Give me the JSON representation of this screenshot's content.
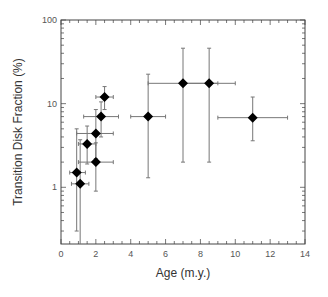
{
  "chart_data": {
    "type": "scatter",
    "title": "",
    "xlabel": "Age (m.y.)",
    "ylabel": "Transition Disk Fraction (%)",
    "xlim": [
      0,
      14
    ],
    "ylim": [
      0.21,
      100
    ],
    "yscale": "log",
    "grid": false,
    "legend": null,
    "x_ticks": [
      0,
      2,
      4,
      6,
      8,
      10,
      12,
      14
    ],
    "y_ticks": [
      1,
      10,
      100
    ],
    "x_tick_labels": [
      "0",
      "2",
      "4",
      "6",
      "8",
      "10",
      "12",
      "14"
    ],
    "y_tick_labels": [
      "1",
      "10",
      "100"
    ],
    "marker": "diamond",
    "marker_color": "#000000",
    "errorbar_color": "#777777",
    "points": [
      {
        "x": 0.9,
        "y": 1.5,
        "x_err": [
          0.5,
          1.4
        ],
        "y_err": [
          0.3,
          5.0
        ]
      },
      {
        "x": 1.1,
        "y": 1.1,
        "x_err": [
          0.6,
          1.6
        ],
        "y_err": [
          0.2,
          3.7
        ]
      },
      {
        "x": 1.5,
        "y": 3.3,
        "x_err": [
          1.0,
          2.0
        ],
        "y_err": [
          1.9,
          5.4
        ]
      },
      {
        "x": 2.0,
        "y": 2.0,
        "x_err": [
          1.0,
          3.0
        ],
        "y_err": [
          0.9,
          3.4
        ]
      },
      {
        "x": 2.0,
        "y": 4.4,
        "x_err": [
          0.9,
          3.0
        ],
        "y_err": [
          2.2,
          8.5
        ]
      },
      {
        "x": 2.3,
        "y": 7.0,
        "x_err": [
          1.3,
          3.3
        ],
        "y_err": [
          4.0,
          10.5
        ]
      },
      {
        "x": 2.5,
        "y": 12.0,
        "x_err": [
          2.0,
          3.0
        ],
        "y_err": [
          8.5,
          16.0
        ]
      },
      {
        "x": 5.0,
        "y": 7.0,
        "x_err": [
          4.0,
          6.0
        ],
        "y_err": [
          1.3,
          22.5
        ]
      },
      {
        "x": 7.0,
        "y": 17.5,
        "x_err": [
          5.0,
          9.0
        ],
        "y_err": [
          2.0,
          46.0
        ]
      },
      {
        "x": 8.5,
        "y": 17.5,
        "x_err": [
          7.0,
          10.0
        ],
        "y_err": [
          2.0,
          46.0
        ]
      },
      {
        "x": 11.0,
        "y": 6.8,
        "x_err": [
          9.0,
          13.0
        ],
        "y_err": [
          3.6,
          12.0
        ]
      }
    ]
  },
  "labels": {
    "xlabel": "Age (m.y.)",
    "ylabel": "Transition Disk Fraction (%)"
  }
}
